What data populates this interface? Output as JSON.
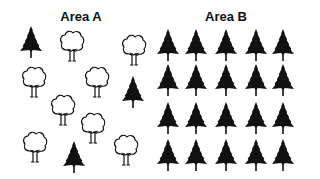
{
  "areas": [
    {
      "id": "A",
      "label": "Area A",
      "label_center_x": 81,
      "trees": [
        {
          "type": "pine",
          "x": 31,
          "y": 42
        },
        {
          "type": "deciduous",
          "x": 72,
          "y": 46
        },
        {
          "type": "deciduous",
          "x": 134,
          "y": 50
        },
        {
          "type": "deciduous",
          "x": 34,
          "y": 82
        },
        {
          "type": "deciduous",
          "x": 97,
          "y": 82
        },
        {
          "type": "pine",
          "x": 133,
          "y": 92
        },
        {
          "type": "deciduous",
          "x": 63,
          "y": 110
        },
        {
          "type": "deciduous",
          "x": 93,
          "y": 128
        },
        {
          "type": "deciduous",
          "x": 35,
          "y": 147
        },
        {
          "type": "pine",
          "x": 74,
          "y": 157
        },
        {
          "type": "deciduous",
          "x": 126,
          "y": 150
        }
      ]
    },
    {
      "id": "B",
      "label": "Area B",
      "label_center_x": 226,
      "grid": {
        "columns": [
          168,
          196,
          226,
          256,
          283
        ],
        "rows": [
          45,
          80,
          118,
          155
        ],
        "type": "pine"
      }
    }
  ],
  "summary": {
    "area_a": {
      "pine": 3,
      "deciduous": 8,
      "total": 11
    },
    "area_b": {
      "pine": 20,
      "deciduous": 0,
      "total": 20
    }
  },
  "colors": {
    "ink": "#111111",
    "background": "#ffffff"
  }
}
